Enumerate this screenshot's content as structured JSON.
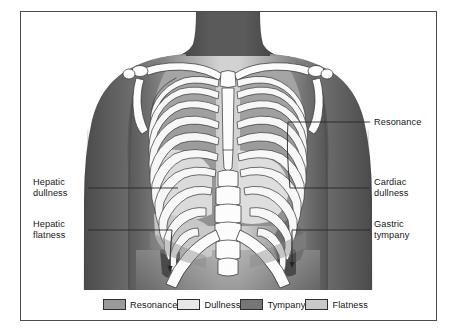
{
  "figure": {
    "border_color": "#4a4a4a",
    "background": "#ffffff"
  },
  "annotations": {
    "right": [
      {
        "id": "resonance",
        "text": "Resonance",
        "leader_y": 122
      },
      {
        "id": "cardiac-dullness",
        "text": "Cardiac\ndullness",
        "leader_y": 188
      },
      {
        "id": "gastric-tympany",
        "text": "Gastric\ntympany",
        "leader_y": 230
      }
    ],
    "left": [
      {
        "id": "hepatic-dullness",
        "text": "Hepatic\ndullness",
        "leader_y": 188
      },
      {
        "id": "hepatic-flatness",
        "text": "Hepatic\nflatness",
        "leader_y": 230
      }
    ]
  },
  "legend": {
    "items": [
      {
        "label": "Resonance",
        "color": "#9a9a9a"
      },
      {
        "label": "Dullness",
        "color": "#e8e8e8"
      },
      {
        "label": "Tympany",
        "color": "#767676"
      },
      {
        "label": "Flatness",
        "color": "#c9c9c9"
      }
    ]
  },
  "colors": {
    "skin_light": "#b9b9b9",
    "skin_mid": "#8e8e8e",
    "skin_dark": "#5f5f5f",
    "neck_dark": "#4f4f4f",
    "bone": "#fdfdfd",
    "bone_outline": "#3a3a3a",
    "resonance": "#9a9a9a",
    "dullness": "#e8e8e8",
    "tympany": "#767676",
    "flatness": "#c9c9c9",
    "leader_line": "#2a2a2a",
    "text": "#161616"
  }
}
